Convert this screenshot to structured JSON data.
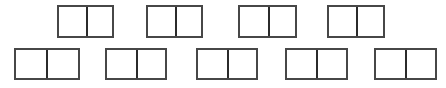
{
  "figure": {
    "background_color": "#ffffff",
    "stroke_color": "#474747",
    "divider_color": "#2b2b2b",
    "stroke_width_px": 2,
    "divider_width_px": 2,
    "canvas_width_px": 446,
    "canvas_height_px": 88,
    "shape_count": 9,
    "cells_per_shape": 2,
    "total_cells": 18,
    "rows": [
      {
        "row_name": "top-row",
        "shape_count": 4,
        "top_px": 5,
        "height_px": 33
      },
      {
        "row_name": "bottom-row",
        "shape_count": 5,
        "top_px": 48,
        "height_px": 32
      }
    ],
    "shapes": [
      {
        "id": "top-1",
        "row": "top-row",
        "index_in_row": 1,
        "cells": 2,
        "x_px": 57,
        "y_px": 5,
        "width_px": 57,
        "height_px": 33,
        "divider_x_px": 29
      },
      {
        "id": "top-2",
        "row": "top-row",
        "index_in_row": 2,
        "cells": 2,
        "x_px": 146,
        "y_px": 5,
        "width_px": 57,
        "height_px": 33,
        "divider_x_px": 29
      },
      {
        "id": "top-3",
        "row": "top-row",
        "index_in_row": 3,
        "cells": 2,
        "x_px": 238,
        "y_px": 5,
        "width_px": 59,
        "height_px": 33,
        "divider_x_px": 30
      },
      {
        "id": "top-4",
        "row": "top-row",
        "index_in_row": 4,
        "cells": 2,
        "x_px": 327,
        "y_px": 5,
        "width_px": 58,
        "height_px": 33,
        "divider_x_px": 29
      },
      {
        "id": "bottom-1",
        "row": "bottom-row",
        "index_in_row": 1,
        "cells": 2,
        "x_px": 14,
        "y_px": 48,
        "width_px": 66,
        "height_px": 32,
        "divider_x_px": 32
      },
      {
        "id": "bottom-2",
        "row": "bottom-row",
        "index_in_row": 2,
        "cells": 2,
        "x_px": 105,
        "y_px": 48,
        "width_px": 62,
        "height_px": 32,
        "divider_x_px": 31
      },
      {
        "id": "bottom-3",
        "row": "bottom-row",
        "index_in_row": 3,
        "cells": 2,
        "x_px": 196,
        "y_px": 48,
        "width_px": 62,
        "height_px": 32,
        "divider_x_px": 31
      },
      {
        "id": "bottom-4",
        "row": "bottom-row",
        "index_in_row": 4,
        "cells": 2,
        "x_px": 285,
        "y_px": 48,
        "width_px": 63,
        "height_px": 32,
        "divider_x_px": 31
      },
      {
        "id": "bottom-5",
        "row": "bottom-row",
        "index_in_row": 5,
        "cells": 2,
        "x_px": 374,
        "y_px": 48,
        "width_px": 63,
        "height_px": 32,
        "divider_x_px": 31
      }
    ]
  }
}
